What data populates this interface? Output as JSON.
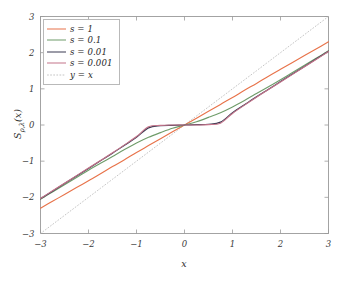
{
  "figure": {
    "background_color": "#ffffff",
    "axis_color": "#9a9a9a",
    "text_color": "#2e2e2e"
  },
  "axes": {
    "x_label": "x",
    "y_label_main": "S",
    "y_label_sub": "ρ,λ",
    "y_label_arg": "(x)",
    "x_ticks": [
      "−3",
      "−2",
      "−1",
      "0",
      "1",
      "2",
      "3"
    ],
    "y_ticks": [
      "3",
      "2",
      "1",
      "0",
      "−1",
      "−2",
      "−3"
    ]
  },
  "legend": {
    "entries": [
      {
        "label": "s = 1",
        "color": "#e8734a",
        "style": "solid"
      },
      {
        "label": "s = 0.1",
        "color": "#6f9c6a",
        "style": "solid"
      },
      {
        "label": "s = 0.01",
        "color": "#3a3a52",
        "style": "solid"
      },
      {
        "label": "s = 0.001",
        "color": "#c4748a",
        "style": "solid"
      },
      {
        "label": "y = x",
        "color": "#bdbdbd",
        "style": "dotted"
      }
    ]
  },
  "chart_data": {
    "type": "line",
    "title": "",
    "xlabel": "x",
    "ylabel": "S_{ρ,λ}(x)",
    "xlim": [
      -3,
      3
    ],
    "ylim": [
      -3,
      3
    ],
    "xticks": [
      -3,
      -2,
      -1,
      0,
      1,
      2,
      3
    ],
    "yticks": [
      -3,
      -2,
      -1,
      0,
      1,
      2,
      3
    ],
    "grid": false,
    "legend_position": "upper left",
    "x": [
      -3,
      -2.75,
      -2.5,
      -2.25,
      -2,
      -1.75,
      -1.5,
      -1.25,
      -1,
      -0.75,
      -0.5,
      -0.25,
      0,
      0.25,
      0.5,
      0.75,
      1,
      1.25,
      1.5,
      1.75,
      2,
      2.25,
      2.5,
      2.75,
      3
    ],
    "series": [
      {
        "name": "s = 1",
        "color": "#e8734a",
        "style": "solid",
        "values": [
          -2.3,
          -2.11,
          -1.92,
          -1.73,
          -1.54,
          -1.35,
          -1.15,
          -0.96,
          -0.76,
          -0.57,
          -0.38,
          -0.19,
          0.0,
          0.19,
          0.38,
          0.57,
          0.76,
          0.96,
          1.15,
          1.35,
          1.54,
          1.73,
          1.92,
          2.11,
          2.3
        ]
      },
      {
        "name": "s = 0.1",
        "color": "#6f9c6a",
        "style": "solid",
        "values": [
          -2.05,
          -1.85,
          -1.65,
          -1.45,
          -1.25,
          -1.06,
          -0.87,
          -0.68,
          -0.5,
          -0.34,
          -0.21,
          -0.09,
          0.0,
          0.09,
          0.21,
          0.34,
          0.5,
          0.68,
          0.87,
          1.06,
          1.25,
          1.45,
          1.65,
          1.85,
          2.05
        ]
      },
      {
        "name": "s = 0.01",
        "color": "#3a3a52",
        "style": "solid",
        "values": [
          -2.04,
          -1.83,
          -1.62,
          -1.41,
          -1.2,
          -0.99,
          -0.78,
          -0.56,
          -0.34,
          -0.08,
          -0.02,
          -0.01,
          0.0,
          0.01,
          0.02,
          0.08,
          0.34,
          0.56,
          0.78,
          0.99,
          1.2,
          1.41,
          1.62,
          1.83,
          2.04
        ]
      },
      {
        "name": "s = 0.001",
        "color": "#c4748a",
        "style": "solid",
        "values": [
          -2.03,
          -1.82,
          -1.61,
          -1.4,
          -1.19,
          -0.98,
          -0.77,
          -0.55,
          -0.32,
          -0.05,
          -0.01,
          0.0,
          0.0,
          0.0,
          0.01,
          0.05,
          0.32,
          0.55,
          0.77,
          0.98,
          1.19,
          1.4,
          1.61,
          1.82,
          2.03
        ]
      },
      {
        "name": "y = x",
        "color": "#bdbdbd",
        "style": "dotted",
        "values": [
          -3,
          -2.75,
          -2.5,
          -2.25,
          -2,
          -1.75,
          -1.5,
          -1.25,
          -1,
          -0.75,
          -0.5,
          -0.25,
          0,
          0.25,
          0.5,
          0.75,
          1,
          1.25,
          1.5,
          1.75,
          2,
          2.25,
          2.5,
          2.75,
          3
        ]
      }
    ]
  }
}
